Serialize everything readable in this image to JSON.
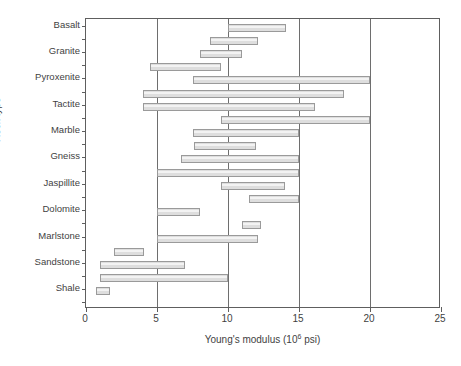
{
  "chart_data": {
    "type": "bar",
    "orientation": "horizontal",
    "style": "range-bars",
    "title": "",
    "xlabel": "Young's modulus (10⁶ psi)",
    "xlabel_base": "Young's modulus (10",
    "xlabel_exp": "6",
    "xlabel_tail": " psi)",
    "ylabel": "Rock type",
    "xlim": [
      0,
      25
    ],
    "xticks": [
      0,
      5,
      10,
      15,
      20,
      25
    ],
    "xticklabels": [
      "0",
      "5",
      "10",
      "15",
      "20",
      "25"
    ],
    "gridlines_x": [
      5,
      10,
      15,
      20
    ],
    "grid": true,
    "legend": "none",
    "categories": [
      "Basalt",
      "Granite",
      "Pyroxenite",
      "Tactite",
      "Marble",
      "Gneiss",
      "Jaspillite",
      "Dolomite",
      "Marlstone",
      "Sandstone",
      "Shale"
    ],
    "bar_color": "#dedede",
    "bar_edge_color": "#9a9a9a",
    "bars": [
      {
        "category": "Basalt",
        "start": 10.0,
        "end": 14.1
      },
      {
        "category": "Basalt",
        "start": 8.7,
        "end": 12.1
      },
      {
        "category": "Granite",
        "start": 8.0,
        "end": 11.0
      },
      {
        "category": "Granite",
        "start": 4.5,
        "end": 9.5
      },
      {
        "category": "Pyroxenite",
        "start": 7.5,
        "end": 20.0
      },
      {
        "category": "Pyroxenite",
        "start": 4.0,
        "end": 18.2
      },
      {
        "category": "Tactite",
        "start": 4.0,
        "end": 16.1
      },
      {
        "category": "Tactite",
        "start": 9.5,
        "end": 20.0
      },
      {
        "category": "Marble",
        "start": 7.5,
        "end": 15.0
      },
      {
        "category": "Marble",
        "start": 7.6,
        "end": 12.0
      },
      {
        "category": "Gneiss",
        "start": 6.7,
        "end": 15.0
      },
      {
        "category": "Gneiss",
        "start": 5.0,
        "end": 15.0
      },
      {
        "category": "Jaspillite",
        "start": 9.5,
        "end": 14.0
      },
      {
        "category": "Jaspillite",
        "start": 11.5,
        "end": 15.0
      },
      {
        "category": "Dolomite",
        "start": 5.0,
        "end": 8.0
      },
      {
        "category": "Dolomite",
        "start": 11.0,
        "end": 12.3
      },
      {
        "category": "Marlstone",
        "start": 5.0,
        "end": 12.1
      },
      {
        "category": "Marlstone",
        "start": 2.0,
        "end": 4.1
      },
      {
        "category": "Sandstone",
        "start": 1.0,
        "end": 7.0
      },
      {
        "category": "Sandstone",
        "start": 1.0,
        "end": 10.0
      },
      {
        "category": "Shale",
        "start": 0.7,
        "end": 1.7
      }
    ]
  }
}
